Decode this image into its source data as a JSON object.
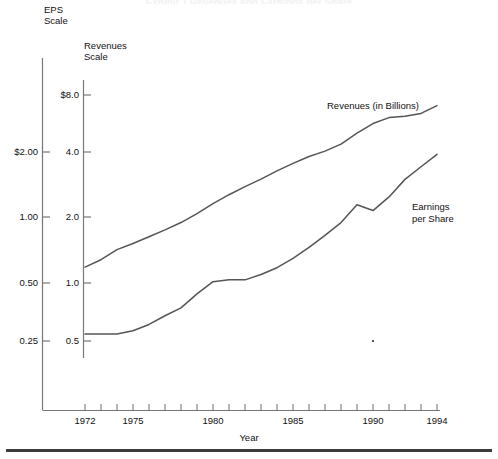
{
  "page": {
    "title_ghost": "Exhibit 1  Revenues and Earnings per Share",
    "background": "#ffffff",
    "line_color": "#555555",
    "axis_color": "#777777",
    "text_color": "#111111"
  },
  "chart_data": {
    "type": "line",
    "title": "",
    "xlabel": "Year",
    "ylabel": "",
    "grid": false,
    "legend_position": "inline-annotations",
    "x": [
      1972,
      1973,
      1974,
      1975,
      1976,
      1977,
      1978,
      1979,
      1980,
      1981,
      1982,
      1983,
      1984,
      1985,
      1986,
      1987,
      1988,
      1989,
      1990,
      1991,
      1992,
      1993,
      1994
    ],
    "xtick_labels": [
      "1972",
      "1975",
      "1980",
      "1985",
      "1990",
      "1994"
    ],
    "xtick_values": [
      1972,
      1975,
      1980,
      1985,
      1990,
      1994
    ],
    "xlim": [
      1971.4,
      1994
    ],
    "axes": [
      {
        "name": "eps-scale",
        "caption": "EPS\nScale",
        "caption_lines": [
          "EPS",
          "Scale"
        ],
        "scale": "log",
        "tick_labels": [
          "$2.00",
          "1.00",
          "0.50",
          "0.25"
        ],
        "tick_values": [
          2.0,
          1.0,
          0.5,
          0.25
        ]
      },
      {
        "name": "revenues-scale",
        "caption": "Revenues\nScale",
        "caption_lines": [
          "Revenues",
          "Scale"
        ],
        "scale": "log",
        "tick_labels": [
          "$8.0",
          "4.0",
          "2.0",
          "1.0",
          "0.5"
        ],
        "tick_values": [
          8.0,
          4.0,
          2.0,
          1.0,
          0.5
        ]
      }
    ],
    "series": [
      {
        "name": "Revenues (in Billions)",
        "label": "Revenues (in Billions)",
        "axis": "revenues-scale",
        "units": "billions of dollars",
        "x": [
          1972,
          1973,
          1974,
          1975,
          1976,
          1977,
          1978,
          1979,
          1980,
          1981,
          1982,
          1983,
          1984,
          1985,
          1986,
          1987,
          1988,
          1989,
          1990,
          1991,
          1992,
          1993,
          1994
        ],
        "values": [
          1.15,
          1.25,
          1.4,
          1.5,
          1.62,
          1.75,
          1.9,
          2.1,
          2.35,
          2.6,
          2.85,
          3.1,
          3.4,
          3.7,
          4.0,
          4.25,
          4.6,
          5.2,
          5.8,
          6.2,
          6.3,
          6.5,
          7.1
        ]
      },
      {
        "name": "Earnings per Share",
        "label": "Earnings\nper Share",
        "label_lines": [
          "Earnings",
          "per Share"
        ],
        "axis": "eps-scale",
        "units": "dollars per share",
        "x": [
          1972,
          1973,
          1974,
          1975,
          1976,
          1977,
          1978,
          1979,
          1980,
          1981,
          1982,
          1983,
          1984,
          1985,
          1986,
          1987,
          1988,
          1989,
          1990,
          1991,
          1992,
          1993,
          1994
        ],
        "values": [
          0.27,
          0.27,
          0.27,
          0.28,
          0.3,
          0.33,
          0.36,
          0.42,
          0.48,
          0.49,
          0.49,
          0.52,
          0.56,
          0.62,
          0.7,
          0.8,
          0.92,
          1.12,
          1.05,
          1.22,
          1.48,
          1.7,
          1.95
        ]
      }
    ],
    "annotations": [
      {
        "name": "revenues-annotation",
        "text": "Revenues (in Billions)"
      },
      {
        "name": "eps-annotation",
        "text": "Earnings per Share"
      }
    ]
  },
  "axis_title": {
    "x": "Year"
  }
}
